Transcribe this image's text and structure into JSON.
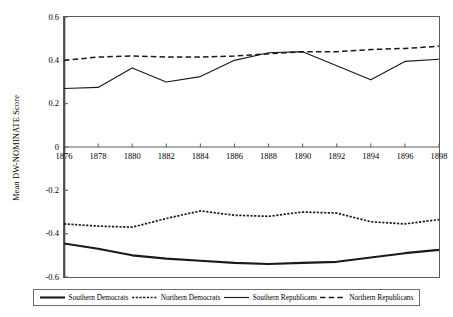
{
  "chart_data": {
    "type": "line",
    "title": "",
    "xlabel": "",
    "ylabel": "Mean DW-NOMINATE Score",
    "x": [
      1876,
      1878,
      1880,
      1882,
      1884,
      1886,
      1888,
      1890,
      1892,
      1894,
      1896,
      1898
    ],
    "xtick_labels": [
      "1876",
      "1878",
      "1880",
      "1882",
      "1884",
      "1886",
      "1888",
      "1890",
      "1892",
      "1894",
      "1896",
      "1898"
    ],
    "ytick_labels": [
      "0.6",
      "0.4",
      "0.2",
      "0",
      "-0.2",
      "-0.4",
      "-0.6"
    ],
    "ytick_values": [
      0.6,
      0.4,
      0.2,
      0,
      -0.2,
      -0.4,
      -0.6
    ],
    "xlim": [
      1876,
      1898
    ],
    "ylim": [
      -0.6,
      0.6
    ],
    "grid": false,
    "legend_position": "bottom",
    "series": [
      {
        "name": "Southern Democrats",
        "style": "solid-thick",
        "color": "#1a1a1a",
        "values": [
          -0.445,
          -0.47,
          -0.5,
          -0.515,
          -0.525,
          -0.535,
          -0.54,
          -0.535,
          -0.53,
          -0.51,
          -0.49,
          -0.475
        ]
      },
      {
        "name": "Northern Democrats",
        "style": "dotted",
        "color": "#1a1a1a",
        "values": [
          -0.355,
          -0.365,
          -0.37,
          -0.33,
          -0.295,
          -0.315,
          -0.32,
          -0.3,
          -0.305,
          -0.345,
          -0.355,
          -0.335
        ]
      },
      {
        "name": "Southern Republicans",
        "style": "solid-thin",
        "color": "#1a1a1a",
        "values": [
          0.27,
          0.275,
          0.365,
          0.3,
          0.325,
          0.4,
          0.435,
          0.44,
          0.375,
          0.31,
          0.395,
          0.405
        ]
      },
      {
        "name": "Northern Republicans",
        "style": "dashed",
        "color": "#1a1a1a",
        "values": [
          0.4,
          0.415,
          0.42,
          0.415,
          0.415,
          0.42,
          0.43,
          0.44,
          0.44,
          0.45,
          0.455,
          0.465
        ]
      }
    ]
  },
  "legend": {
    "items": [
      {
        "label": "Southern Democrats"
      },
      {
        "label": "Northern Democrats"
      },
      {
        "label": "Southern Republicans"
      },
      {
        "label": "Northern Republicans"
      }
    ]
  }
}
